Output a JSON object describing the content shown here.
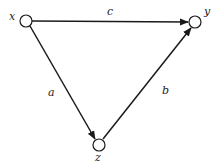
{
  "diagram": {
    "type": "directed-graph",
    "nodes": [
      {
        "id": "x",
        "label": "x",
        "cx": 26,
        "cy": 21
      },
      {
        "id": "y",
        "label": "y",
        "cx": 195,
        "cy": 22
      },
      {
        "id": "z",
        "label": "z",
        "cx": 99,
        "cy": 145
      }
    ],
    "edges": [
      {
        "from": "x",
        "to": "y",
        "label": "c"
      },
      {
        "from": "x",
        "to": "z",
        "label": "a"
      },
      {
        "from": "z",
        "to": "y",
        "label": "b"
      }
    ],
    "colors": {
      "stroke": "#1a1a1a",
      "background": "#ffffff"
    }
  }
}
